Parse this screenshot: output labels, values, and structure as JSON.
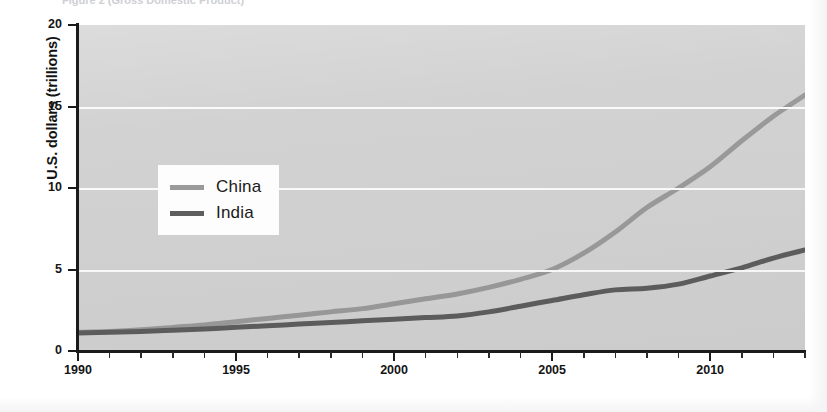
{
  "figure": {
    "title_cutoff": "Figure 2   (Gross Domestic Product)",
    "background_color": "#ffffff",
    "plot_background_color": "#d2d2d2"
  },
  "chart_data": {
    "type": "line",
    "title": "",
    "xlabel": "",
    "ylabel": "U.S. dollars (trillions)",
    "xlim": [
      1990,
      2013
    ],
    "ylim": [
      0,
      20
    ],
    "xticks": [
      1990,
      1995,
      2000,
      2005,
      2010
    ],
    "xtick_labels": [
      "1990",
      "1995",
      "2000",
      "2005",
      "2010"
    ],
    "minor_xticks_every": 1,
    "yticks": [
      0,
      5,
      10,
      15,
      20
    ],
    "ytick_labels": [
      "0",
      "5",
      "10",
      "15",
      "20"
    ],
    "grid": "horizontal-white-at-5-10-15",
    "legend_position": "upper-left-inside",
    "x": [
      1990,
      1991,
      1992,
      1993,
      1994,
      1995,
      1996,
      1997,
      1998,
      1999,
      2000,
      2001,
      2002,
      2003,
      2004,
      2005,
      2006,
      2007,
      2008,
      2009,
      2010,
      2011,
      2012,
      2013
    ],
    "series": [
      {
        "name": "China",
        "color": "#9a9a9a",
        "line_width": 5,
        "values": [
          1.15,
          1.2,
          1.3,
          1.45,
          1.6,
          1.8,
          2.0,
          2.2,
          2.4,
          2.6,
          2.9,
          3.2,
          3.5,
          3.9,
          4.4,
          5.0,
          6.0,
          7.3,
          8.8,
          10.0,
          11.3,
          12.9,
          14.4,
          15.7
        ]
      },
      {
        "name": "India",
        "color": "#5e5e5e",
        "line_width": 5,
        "values": [
          1.1,
          1.15,
          1.2,
          1.28,
          1.35,
          1.45,
          1.55,
          1.65,
          1.75,
          1.85,
          1.95,
          2.05,
          2.15,
          2.4,
          2.75,
          3.1,
          3.45,
          3.75,
          3.85,
          4.1,
          4.6,
          5.1,
          5.7,
          6.2
        ]
      }
    ]
  },
  "axes": {
    "y_title": "U.S. dollars (trillions)"
  },
  "legend": {
    "items": [
      {
        "label": "China",
        "color": "#9a9a9a"
      },
      {
        "label": "India",
        "color": "#5e5e5e"
      }
    ]
  }
}
